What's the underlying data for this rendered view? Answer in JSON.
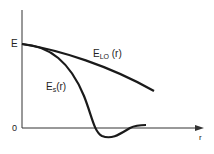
{
  "diagram": {
    "y_axis_labels": {
      "top": "E",
      "bottom": "0"
    },
    "x_axis_label": "r",
    "curves": [
      {
        "id": "elo",
        "main": "E",
        "sub": "LO",
        "arg": " (r)"
      },
      {
        "id": "es",
        "main": "E",
        "sub": "s",
        "arg": "(r)"
      }
    ],
    "colors": {
      "stroke": "#1a1a1a",
      "background": "#ffffff"
    }
  }
}
